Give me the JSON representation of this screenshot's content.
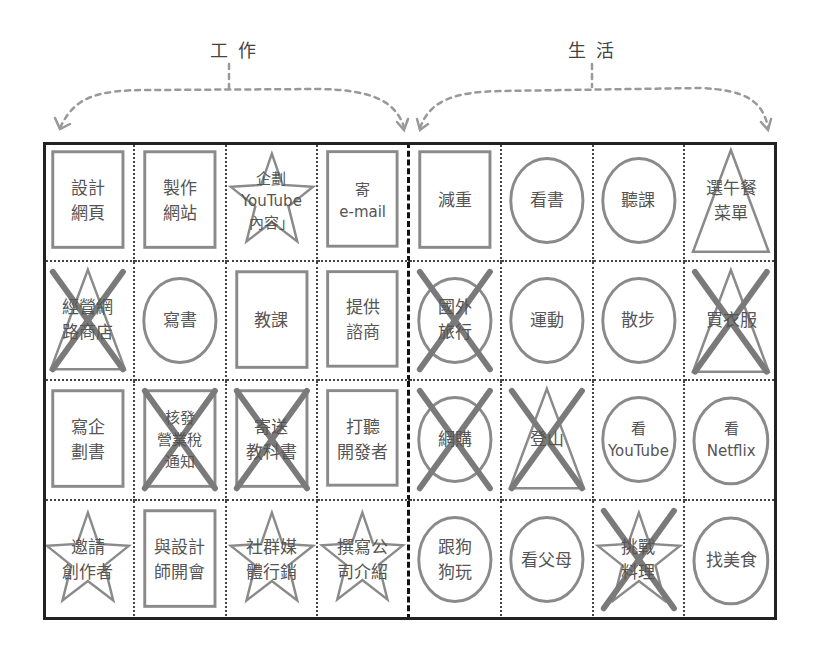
{
  "headers": {
    "work": "工作",
    "life": "生活"
  },
  "colors": {
    "frame": "#222222",
    "shape_stroke": "#8a8a8a",
    "cross_stroke": "#7a7a7a",
    "arrow": "#999999",
    "text": "#555555"
  },
  "legend_shapes": [
    "rectangle",
    "circle",
    "star",
    "triangle"
  ],
  "grid": {
    "columns": 8,
    "rows": 4,
    "work_columns": [
      0,
      1,
      2,
      3
    ],
    "life_columns": [
      4,
      5,
      6,
      7
    ],
    "cells": [
      {
        "row": 0,
        "col": 0,
        "section": "work",
        "shape": "rectangle",
        "crossed": false,
        "label": "設計\n網頁"
      },
      {
        "row": 0,
        "col": 1,
        "section": "work",
        "shape": "rectangle",
        "crossed": false,
        "label": "製作\n網站"
      },
      {
        "row": 0,
        "col": 2,
        "section": "work",
        "shape": "star",
        "crossed": false,
        "label": "企劃\nYouTube\n內容」"
      },
      {
        "row": 0,
        "col": 3,
        "section": "work",
        "shape": "rectangle",
        "crossed": false,
        "label": "寄\ne-mail"
      },
      {
        "row": 0,
        "col": 4,
        "section": "life",
        "shape": "rectangle",
        "crossed": false,
        "label": "減重"
      },
      {
        "row": 0,
        "col": 5,
        "section": "life",
        "shape": "circle",
        "crossed": false,
        "label": "看書"
      },
      {
        "row": 0,
        "col": 6,
        "section": "life",
        "shape": "circle",
        "crossed": false,
        "label": "聽課"
      },
      {
        "row": 0,
        "col": 7,
        "section": "life",
        "shape": "triangle",
        "crossed": false,
        "label": "選午餐\n菜單"
      },
      {
        "row": 1,
        "col": 0,
        "section": "work",
        "shape": "triangle",
        "crossed": true,
        "label": "經營網\n路商店"
      },
      {
        "row": 1,
        "col": 1,
        "section": "work",
        "shape": "circle",
        "crossed": false,
        "label": "寫書"
      },
      {
        "row": 1,
        "col": 2,
        "section": "work",
        "shape": "rectangle",
        "crossed": false,
        "label": "教課"
      },
      {
        "row": 1,
        "col": 3,
        "section": "work",
        "shape": "rectangle",
        "crossed": false,
        "label": "提供\n諮商"
      },
      {
        "row": 1,
        "col": 4,
        "section": "life",
        "shape": "circle",
        "crossed": true,
        "label": "國外\n旅行"
      },
      {
        "row": 1,
        "col": 5,
        "section": "life",
        "shape": "circle",
        "crossed": false,
        "label": "運動"
      },
      {
        "row": 1,
        "col": 6,
        "section": "life",
        "shape": "circle",
        "crossed": false,
        "label": "散步"
      },
      {
        "row": 1,
        "col": 7,
        "section": "life",
        "shape": "triangle",
        "crossed": true,
        "label": "買衣服"
      },
      {
        "row": 2,
        "col": 0,
        "section": "work",
        "shape": "rectangle",
        "crossed": false,
        "label": "寫企\n劃書"
      },
      {
        "row": 2,
        "col": 1,
        "section": "work",
        "shape": "rectangle",
        "crossed": true,
        "label": "核發\n營業稅\n通知"
      },
      {
        "row": 2,
        "col": 2,
        "section": "work",
        "shape": "rectangle",
        "crossed": true,
        "label": "寄送\n教科書"
      },
      {
        "row": 2,
        "col": 3,
        "section": "work",
        "shape": "rectangle",
        "crossed": false,
        "label": "打聽\n開發者"
      },
      {
        "row": 2,
        "col": 4,
        "section": "life",
        "shape": "circle",
        "crossed": true,
        "label": "網購"
      },
      {
        "row": 2,
        "col": 5,
        "section": "life",
        "shape": "triangle",
        "crossed": true,
        "label": "登山"
      },
      {
        "row": 2,
        "col": 6,
        "section": "life",
        "shape": "circle",
        "crossed": false,
        "label": "看\nYouTube"
      },
      {
        "row": 2,
        "col": 7,
        "section": "life",
        "shape": "circle",
        "crossed": false,
        "label": "看\nNetflix"
      },
      {
        "row": 3,
        "col": 0,
        "section": "work",
        "shape": "star",
        "crossed": false,
        "label": "邀請\n創作者"
      },
      {
        "row": 3,
        "col": 1,
        "section": "work",
        "shape": "rectangle",
        "crossed": false,
        "label": "與設計\n師開會"
      },
      {
        "row": 3,
        "col": 2,
        "section": "work",
        "shape": "star",
        "crossed": false,
        "label": "社群媒\n體行銷"
      },
      {
        "row": 3,
        "col": 3,
        "section": "work",
        "shape": "star",
        "crossed": false,
        "label": "撰寫公\n司介紹"
      },
      {
        "row": 3,
        "col": 4,
        "section": "life",
        "shape": "circle",
        "crossed": false,
        "label": "跟狗\n狗玩"
      },
      {
        "row": 3,
        "col": 5,
        "section": "life",
        "shape": "circle",
        "crossed": false,
        "label": "看父母"
      },
      {
        "row": 3,
        "col": 6,
        "section": "life",
        "shape": "star",
        "crossed": true,
        "label": "挑戰\n料理"
      },
      {
        "row": 3,
        "col": 7,
        "section": "life",
        "shape": "circle",
        "crossed": false,
        "label": "找美食"
      }
    ]
  }
}
